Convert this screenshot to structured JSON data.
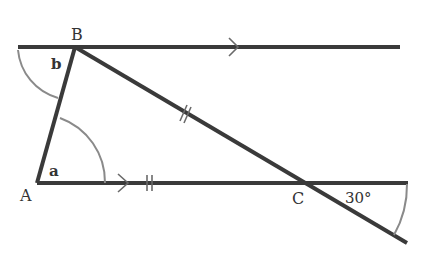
{
  "diagram": {
    "type": "geometry",
    "points": {
      "A": {
        "label": "A",
        "x": 37,
        "y": 183
      },
      "B": {
        "label": "B",
        "x": 75,
        "y": 47
      },
      "C": {
        "label": "C",
        "x": 305,
        "y": 183
      }
    },
    "angle_labels": {
      "a": "a",
      "b": "b",
      "c_angle": "30°"
    },
    "markings": {
      "parallel_arrows": [
        "top-line",
        "bottom-line"
      ],
      "equal_length_ticks": [
        "AC",
        "BC"
      ]
    },
    "colors": {
      "line": "#3a3a3a",
      "arc": "#8a8a8a",
      "text": "#333333"
    }
  }
}
